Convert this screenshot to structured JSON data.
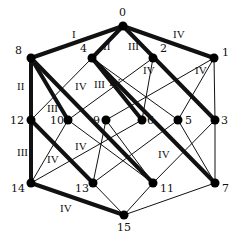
{
  "diagram": {
    "colors": {
      "line": "#111111",
      "node": "#000000",
      "background": "#ffffff"
    },
    "nodes": [
      {
        "id": "0",
        "x": 123,
        "y": 26,
        "lx": 119,
        "ly": 16
      },
      {
        "id": "8",
        "x": 31,
        "y": 58,
        "lx": 15,
        "ly": 54
      },
      {
        "id": "4",
        "x": 92,
        "y": 58,
        "lx": 80,
        "ly": 52
      },
      {
        "id": "2",
        "x": 153,
        "y": 58,
        "lx": 160,
        "ly": 52
      },
      {
        "id": "1",
        "x": 214,
        "y": 58,
        "lx": 222,
        "ly": 56
      },
      {
        "id": "12",
        "x": 31,
        "y": 120,
        "lx": 10,
        "ly": 124
      },
      {
        "id": "10",
        "x": 68,
        "y": 120,
        "lx": 50,
        "ly": 124
      },
      {
        "id": "9",
        "x": 106,
        "y": 120,
        "lx": 93,
        "ly": 124
      },
      {
        "id": "6",
        "x": 142,
        "y": 120,
        "lx": 147,
        "ly": 124
      },
      {
        "id": "5",
        "x": 178,
        "y": 120,
        "lx": 185,
        "ly": 124
      },
      {
        "id": "3",
        "x": 215,
        "y": 120,
        "lx": 221,
        "ly": 124
      },
      {
        "id": "14",
        "x": 31,
        "y": 183,
        "lx": 11,
        "ly": 192
      },
      {
        "id": "13",
        "x": 93,
        "y": 183,
        "lx": 75,
        "ly": 192
      },
      {
        "id": "11",
        "x": 153,
        "y": 183,
        "lx": 160,
        "ly": 192
      },
      {
        "id": "7",
        "x": 215,
        "y": 183,
        "lx": 222,
        "ly": 192
      },
      {
        "id": "15",
        "x": 124,
        "y": 215,
        "lx": 117,
        "ly": 231
      }
    ],
    "thick_edges": [
      [
        "0",
        "8"
      ],
      [
        "0",
        "4"
      ],
      [
        "0",
        "1"
      ],
      [
        "0",
        "3"
      ],
      [
        "8",
        "12"
      ],
      [
        "12",
        "14"
      ],
      [
        "14",
        "15"
      ],
      [
        "8",
        "10"
      ],
      [
        "8",
        "11"
      ],
      [
        "12",
        "13"
      ],
      [
        "4",
        "6"
      ],
      [
        "4",
        "7"
      ]
    ],
    "thin_edges": [
      [
        "4",
        "12"
      ],
      [
        "4",
        "5"
      ],
      [
        "2",
        "10"
      ],
      [
        "2",
        "6"
      ],
      [
        "2",
        "3"
      ],
      [
        "1",
        "9"
      ],
      [
        "1",
        "5"
      ],
      [
        "1",
        "3"
      ],
      [
        "10",
        "14"
      ],
      [
        "10",
        "11"
      ],
      [
        "9",
        "13"
      ],
      [
        "9",
        "11"
      ],
      [
        "6",
        "14"
      ],
      [
        "5",
        "13"
      ],
      [
        "5",
        "7"
      ],
      [
        "3",
        "11"
      ],
      [
        "3",
        "7"
      ],
      [
        "13",
        "15"
      ],
      [
        "11",
        "15"
      ],
      [
        "7",
        "15"
      ]
    ],
    "edge_labels": [
      {
        "text": "I",
        "x": 72,
        "y": 38
      },
      {
        "text": "II",
        "x": 103,
        "y": 50
      },
      {
        "text": "III",
        "x": 128,
        "y": 50
      },
      {
        "text": "IV",
        "x": 173,
        "y": 38
      },
      {
        "text": "II",
        "x": 17,
        "y": 90
      },
      {
        "text": "IV",
        "x": 75,
        "y": 90
      },
      {
        "text": "III",
        "x": 94,
        "y": 88
      },
      {
        "text": "IV",
        "x": 143,
        "y": 74
      },
      {
        "text": "IV",
        "x": 195,
        "y": 74
      },
      {
        "text": "III",
        "x": 47,
        "y": 112
      },
      {
        "text": "IV",
        "x": 109,
        "y": 86
      },
      {
        "text": "III",
        "x": 17,
        "y": 156
      },
      {
        "text": "IV",
        "x": 47,
        "y": 163
      },
      {
        "text": "IV",
        "x": 75,
        "y": 150
      },
      {
        "text": "IV",
        "x": 158,
        "y": 158
      },
      {
        "text": "IV",
        "x": 60,
        "y": 212
      }
    ]
  }
}
